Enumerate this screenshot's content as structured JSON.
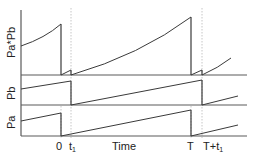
{
  "diagram": {
    "type": "timing-waveform",
    "y_labels": {
      "product": "Pa*Pb",
      "pb": "Pb",
      "pa": "Pa"
    },
    "x_labels": {
      "zero": "0",
      "t1_base": "t",
      "t1_sub": "1",
      "time": "Time",
      "T": "T",
      "Tt1_base": "T+t",
      "Tt1_sub": "1"
    },
    "colors": {
      "axis": "#5a5a5a",
      "curve": "#3a3a3a",
      "guide": "#b8b8b8",
      "text": "#222222"
    }
  }
}
